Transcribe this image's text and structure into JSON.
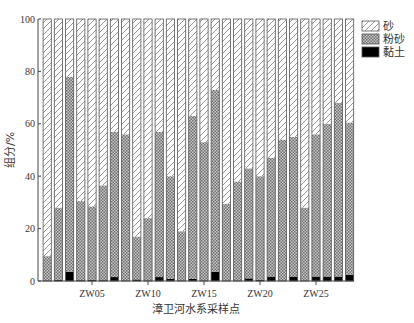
{
  "chart_data": {
    "type": "bar",
    "stacked": true,
    "title": "",
    "xlabel": "漳卫河水系采样点",
    "ylabel": "组分/%",
    "ylim": [
      0,
      100
    ],
    "yticks": [
      0,
      20,
      40,
      60,
      80,
      100
    ],
    "grid": false,
    "legend_position": "top-right",
    "categories": [
      "ZW01",
      "ZW02",
      "ZW03",
      "ZW04",
      "ZW05",
      "ZW06",
      "ZW07",
      "ZW08",
      "ZW09",
      "ZW10",
      "ZW11",
      "ZW12",
      "ZW13",
      "ZW14",
      "ZW15",
      "ZW16",
      "ZW17",
      "ZW18",
      "ZW19",
      "ZW20",
      "ZW21",
      "ZW22",
      "ZW23",
      "ZW24",
      "ZW25",
      "ZW26",
      "ZW27",
      "ZW28"
    ],
    "xtick_labels": [
      {
        "index": 4,
        "label": "ZW05"
      },
      {
        "index": 9,
        "label": "ZW10"
      },
      {
        "index": 14,
        "label": "ZW15"
      },
      {
        "index": 19,
        "label": "ZW20"
      },
      {
        "index": 24,
        "label": "ZW25"
      }
    ],
    "series": [
      {
        "name": "黏土",
        "pattern": "solid-black",
        "values": [
          0,
          0.5,
          3.5,
          0.3,
          0.5,
          0.3,
          1.5,
          0,
          0.6,
          0.2,
          1.5,
          0.8,
          0.2,
          0.8,
          0,
          3.5,
          0,
          0,
          1,
          0.5,
          1.7,
          0,
          1.7,
          0,
          1.7,
          1.7,
          1.7,
          2.3
        ]
      },
      {
        "name": "粉砂",
        "pattern": "crosshatch-gray",
        "values": [
          9.5,
          27.5,
          74.5,
          30.2,
          28,
          36.2,
          55.5,
          56,
          16.4,
          23.8,
          55.5,
          39.2,
          18.8,
          62.2,
          53,
          69.5,
          29.5,
          38,
          42,
          39.5,
          45.3,
          54,
          53.3,
          28,
          54.3,
          58.3,
          66.3,
          58.2
        ]
      },
      {
        "name": "砂",
        "pattern": "diagonal-hatch",
        "values": [
          90.5,
          72,
          22,
          69.5,
          71.5,
          63.5,
          43,
          44,
          83,
          76,
          43,
          60,
          81,
          37,
          47,
          27,
          70.5,
          62,
          57,
          60,
          53,
          46,
          45,
          72,
          44,
          40,
          32,
          39.5
        ]
      }
    ]
  },
  "legend": {
    "items": [
      {
        "label": "砂",
        "pattern": "diagonal-hatch"
      },
      {
        "label": "粉砂",
        "pattern": "crosshatch-gray"
      },
      {
        "label": "黏土",
        "pattern": "solid-black"
      }
    ]
  },
  "colors": {
    "axis": "#444444",
    "bar_outline": "#555555",
    "clay": "#000000",
    "silt_fill": "#9a9a9a",
    "sand_hatch": "#777777"
  }
}
